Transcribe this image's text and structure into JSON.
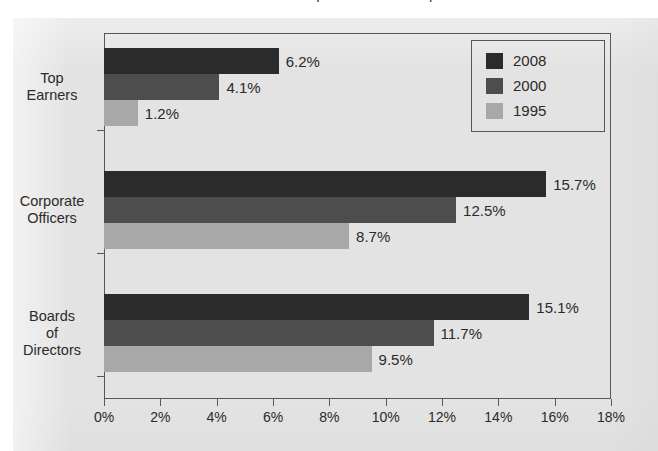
{
  "figure": {
    "title_remnant": "Women in Corporate Leadership",
    "background_color": "#e3e3e3",
    "frame_color": "#575757"
  },
  "legend": {
    "position": "top-right",
    "items": [
      {
        "label": "2008",
        "color": "#2b2b2b"
      },
      {
        "label": "2000",
        "color": "#4d4d4d"
      },
      {
        "label": "1995",
        "color": "#a8a8a8"
      }
    ]
  },
  "chart_data": {
    "type": "bar",
    "orientation": "horizontal",
    "title": "",
    "xlabel": "",
    "ylabel": "",
    "categories": [
      "Top Earners",
      "Corporate Officers",
      "Boards of Directors"
    ],
    "category_lines": [
      [
        "Top",
        "Earners"
      ],
      [
        "Corporate",
        "Officers"
      ],
      [
        "Boards",
        "of",
        "Directors"
      ]
    ],
    "series": [
      {
        "name": "2008",
        "color": "#2b2b2b",
        "values": [
          6.2,
          15.7,
          15.1
        ]
      },
      {
        "name": "2000",
        "color": "#4d4d4d",
        "values": [
          4.1,
          12.5,
          11.7
        ]
      },
      {
        "name": "1995",
        "color": "#a8a8a8",
        "values": [
          1.2,
          8.7,
          9.5
        ]
      }
    ],
    "data_labels": [
      [
        "6.2%",
        "15.7%",
        "15.1%"
      ],
      [
        "4.1%",
        "12.5%",
        "11.7%"
      ],
      [
        "1.2%",
        "8.7%",
        "9.5%"
      ]
    ],
    "xlim": [
      0,
      18
    ],
    "xticks": [
      0,
      2,
      4,
      6,
      8,
      10,
      12,
      14,
      16,
      18
    ],
    "xtick_labels": [
      "0%",
      "2%",
      "4%",
      "6%",
      "8%",
      "10%",
      "12%",
      "14%",
      "16%",
      "18%"
    ],
    "grid": false,
    "value_unit": "%"
  }
}
